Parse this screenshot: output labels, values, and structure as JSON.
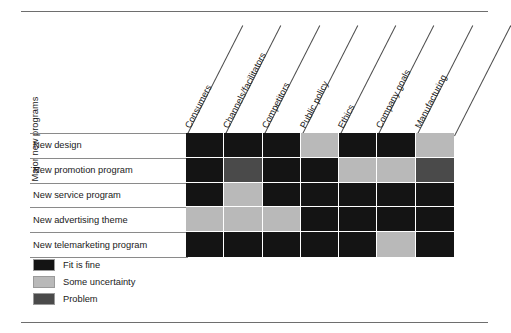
{
  "figure": {
    "axis_y_title": "Major new programs"
  },
  "chart_data": {
    "type": "heatmap",
    "title": "",
    "xlabel": "",
    "ylabel": "Major new programs",
    "grid": true,
    "legend_position": "bottom-left",
    "columns": [
      "Consumers",
      "Channels/facilitators",
      "Competitors",
      "Public policy",
      "Ethics",
      "Company goals",
      "Manufacturing"
    ],
    "rows": [
      "New design",
      "New promotion program",
      "New service program",
      "New advertising theme",
      "New telemarketing program"
    ],
    "categories_legend": [
      {
        "key": "fit",
        "label": "Fit is fine",
        "color": "#141414"
      },
      {
        "key": "some",
        "label": "Some uncertainty",
        "color": "#b9b9b9"
      },
      {
        "key": "problem",
        "label": "Problem",
        "color": "#4a4a4a"
      }
    ],
    "values": [
      [
        "fit",
        "fit",
        "fit",
        "some",
        "fit",
        "fit",
        "some"
      ],
      [
        "fit",
        "problem",
        "fit",
        "fit",
        "some",
        "some",
        "problem"
      ],
      [
        "fit",
        "some",
        "fit",
        "fit",
        "fit",
        "fit",
        "fit"
      ],
      [
        "some",
        "some",
        "some",
        "fit",
        "fit",
        "fit",
        "fit"
      ],
      [
        "fit",
        "fit",
        "fit",
        "fit",
        "fit",
        "some",
        "fit"
      ]
    ]
  }
}
